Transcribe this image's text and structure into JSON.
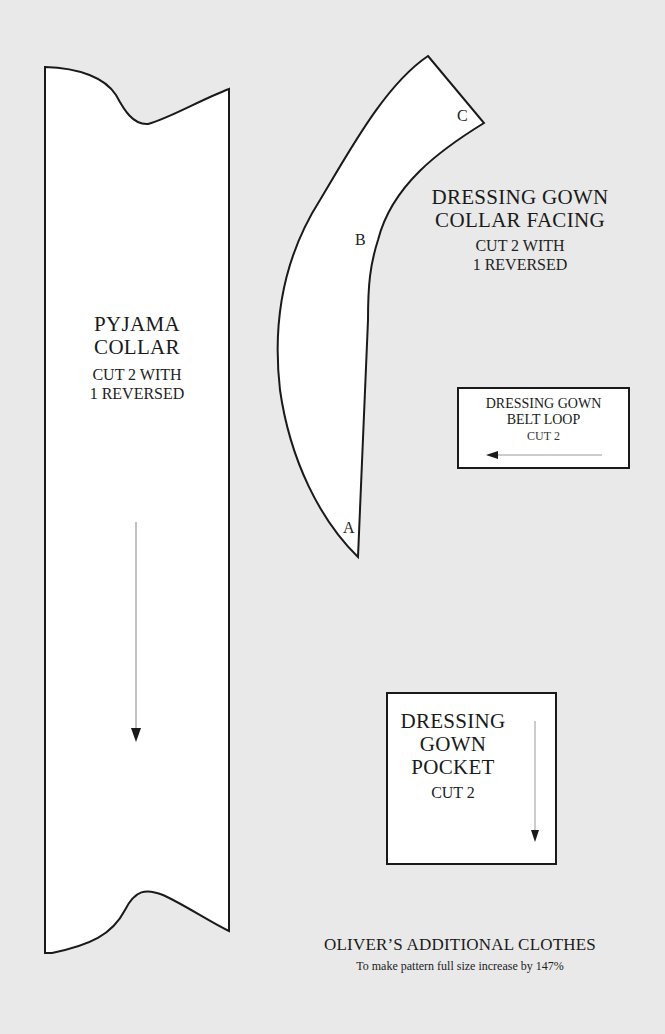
{
  "pieces": {
    "pyjama_collar": {
      "title_line1": "PYJAMA",
      "title_line2": "COLLAR",
      "instruction_line1": "CUT 2 WITH",
      "instruction_line2": "1 REVERSED"
    },
    "collar_facing": {
      "title_line1": "DRESSING GOWN",
      "title_line2": "COLLAR FACING",
      "instruction_line1": "CUT 2 WITH",
      "instruction_line2": "1 REVERSED",
      "markers": {
        "a": "A",
        "b": "B",
        "c": "C"
      }
    },
    "belt_loop": {
      "title_line1": "DRESSING GOWN",
      "title_line2": "BELT LOOP",
      "instruction": "CUT 2"
    },
    "pocket": {
      "title_line1": "DRESSING",
      "title_line2": "GOWN",
      "title_line3": "POCKET",
      "instruction": "CUT 2"
    }
  },
  "footer": {
    "title": "OLIVER’S ADDITIONAL CLOTHES",
    "note": "To make pattern full size increase by 147%"
  }
}
